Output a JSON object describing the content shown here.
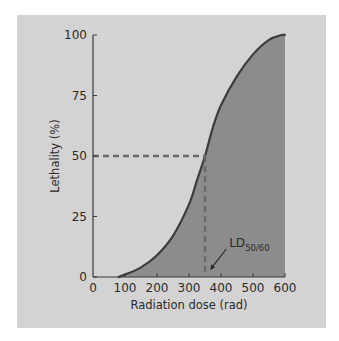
{
  "chart_data": {
    "type": "area",
    "title": "",
    "xlabel": "Radiation dose (rad)",
    "ylabel": "Lethality (%)",
    "xlim": [
      0,
      600
    ],
    "ylim": [
      0,
      100
    ],
    "x_ticks": [
      0,
      100,
      200,
      300,
      400,
      500,
      600
    ],
    "x_tick_labels": [
      "0",
      "100",
      "200",
      "300",
      "400",
      "500",
      "600"
    ],
    "y_ticks": [
      0,
      25,
      50,
      75,
      100
    ],
    "y_tick_labels": [
      "0",
      "25",
      "50",
      "75",
      "100"
    ],
    "grid": false,
    "series": [
      {
        "name": "Lethality",
        "x": [
          80,
          100,
          150,
          200,
          250,
          300,
          325,
          350,
          375,
          400,
          450,
          500,
          550,
          590,
          600
        ],
        "y": [
          0,
          1,
          4,
          9,
          17,
          30,
          40,
          50,
          62,
          71,
          83,
          92,
          98,
          100,
          100
        ]
      }
    ],
    "reference_lines": [
      {
        "type": "horizontal",
        "y": 50,
        "x_from": 0,
        "x_to": 350,
        "style": "dashed"
      },
      {
        "type": "vertical",
        "x": 350,
        "y_from": 0,
        "y_to": 50,
        "style": "dashed"
      }
    ],
    "annotations": [
      {
        "text": "LD",
        "subscript": "50/60",
        "points_to": {
          "x": 360,
          "y": 2
        }
      }
    ]
  },
  "colors": {
    "panel": "#d3d3d3",
    "fill": "#8c8c8c",
    "line": "#3c3c3c",
    "dash": "#6a6a6a",
    "axis": "#3a3a3a"
  }
}
